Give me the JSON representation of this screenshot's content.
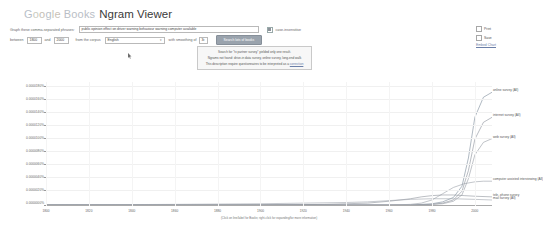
{
  "header": {
    "logo_google": "Google",
    "logo_books": "Books",
    "title": "Ngram Viewer"
  },
  "query": {
    "graph_label": "Graph these comma-separated phrases:",
    "phrases_value": "public opinion effect on driver warning behaviour warning computer available",
    "case_insensitive_label": "case-insensitive",
    "between_label": "between",
    "year_start": "1800",
    "and_label": "and",
    "year_end": "2000",
    "corpus_label": "from the corpus",
    "corpus_value": "English",
    "smoothing_label": "with smoothing of",
    "smoothing_value": "3",
    "search_button": "Search lots of books",
    "caret": "▾"
  },
  "toolbar": {
    "print_label": "Print",
    "save_label": "Save",
    "embed_label": "Embed Chart"
  },
  "notice": {
    "line1": "Search for \"tv partner survey\" yielded only one result.",
    "line2": "Ngrams not found: drive-in data survey, online survey, long-end walk",
    "line3_pre": "This description",
    "line3_mid": "require questionnaires to be interpreted as a",
    "line3_link": "correction"
  },
  "chart_data": {
    "type": "line",
    "title": "",
    "xlabel": "",
    "ylabel": "",
    "xlim": [
      1800,
      2008
    ],
    "ylim": [
      0,
      1.9e-05
    ],
    "grid": true,
    "legend": "inline-right",
    "xticks": [
      1800,
      1820,
      1840,
      1860,
      1880,
      1900,
      1920,
      1940,
      1960,
      1980,
      2000
    ],
    "yticks": [
      "0.0000180%",
      "0.0000160%",
      "0.0000140%",
      "0.0000120%",
      "0.0000100%",
      "0.0000080%",
      "0.0000060%",
      "0.0000040%",
      "0.0000020%",
      "0.0000000%"
    ],
    "ytick_values": [
      1.8e-05,
      1.6e-05,
      1.4e-05,
      1.2e-05,
      1e-05,
      8e-06,
      6e-06,
      4e-06,
      2e-06,
      0.0
    ],
    "footnote": "(Click on line/label for Books; right-click for expanding/for more information)",
    "series": [
      {
        "name": "online survey (All)",
        "label": "online survey (All)",
        "color": "#7a8a99",
        "x": [
          1800,
          1900,
          1940,
          1960,
          1970,
          1980,
          1985,
          1990,
          1994,
          1997,
          2000,
          2004,
          2008
        ],
        "values": [
          0,
          0,
          0,
          0,
          0,
          2e-07,
          5e-07,
          1.2e-06,
          3e-06,
          7.5e-06,
          1.4e-05,
          1.72e-05,
          1.8e-05
        ]
      },
      {
        "name": "internet survey (All)",
        "label": "internet survey (All)",
        "color": "#8a8f98",
        "x": [
          1800,
          1900,
          1940,
          1960,
          1970,
          1980,
          1985,
          1990,
          1994,
          1997,
          2000,
          2004,
          2008
        ],
        "values": [
          0,
          0,
          0,
          0,
          0,
          1e-07,
          3e-07,
          8e-07,
          2.2e-06,
          5.5e-06,
          1.05e-05,
          1.32e-05,
          1.4e-05
        ]
      },
      {
        "name": "web survey (All)",
        "label": "web survey (All)",
        "color": "#959aa2",
        "x": [
          1800,
          1900,
          1940,
          1960,
          1970,
          1980,
          1985,
          1990,
          1994,
          1997,
          2000,
          2004,
          2008
        ],
        "values": [
          0,
          0,
          0,
          0,
          0,
          1e-07,
          2e-07,
          6e-07,
          1.6e-06,
          4.2e-06,
          8e-06,
          1e-05,
          1.06e-05
        ]
      },
      {
        "name": "computer assisted interviewing (All)",
        "label": "computer assisted interviewing (All)",
        "color": "#9aa0a8",
        "x": [
          1800,
          1900,
          1940,
          1960,
          1970,
          1975,
          1980,
          1985,
          1990,
          1995,
          2000,
          2004,
          2008
        ],
        "values": [
          0,
          0,
          0,
          0,
          1e-07,
          3e-07,
          8e-07,
          1.8e-06,
          2.8e-06,
          3.4e-06,
          3.7e-06,
          3.8e-06,
          3.8e-06
        ]
      },
      {
        "name": "tele-phone survey (All)",
        "label": "tele- phone survey",
        "color": "#8f949c",
        "x": [
          1800,
          1900,
          1930,
          1950,
          1960,
          1970,
          1975,
          1980,
          1985,
          1990,
          1995,
          2000,
          2008
        ],
        "values": [
          0,
          0,
          1e-07,
          3e-07,
          6e-07,
          1e-06,
          1.3e-06,
          1.5e-06,
          1.6e-06,
          1.6e-06,
          1.5e-06,
          1.4e-06,
          1.3e-06
        ]
      },
      {
        "name": "mail survey (All)",
        "label": "mail survey (All)",
        "color": "#a0a5ac",
        "x": [
          1800,
          1860,
          1900,
          1920,
          1940,
          1950,
          1960,
          1970,
          1980,
          1990,
          2000,
          2008
        ],
        "values": [
          0,
          1e-07,
          2e-07,
          3e-07,
          4e-07,
          5e-07,
          7e-07,
          9e-07,
          1e-06,
          1e-06,
          9e-07,
          8e-07
        ]
      }
    ]
  }
}
